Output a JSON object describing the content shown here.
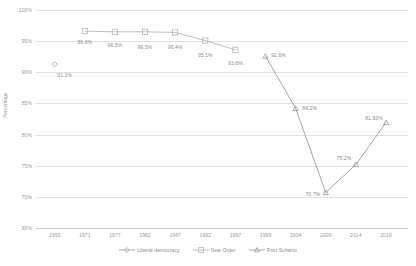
{
  "chart_data": {
    "type": "line",
    "title": "",
    "xlabel": "",
    "ylabel": "Percentage",
    "ylim": [
      65,
      100
    ],
    "ytick_labels": [
      "100%",
      "95%",
      "90%",
      "85%",
      "80%",
      "75%",
      "70%",
      "65%"
    ],
    "ytick_values": [
      100,
      95,
      90,
      85,
      80,
      75,
      70,
      65
    ],
    "grid": true,
    "legend_position": "bottom",
    "categories": [
      "1955",
      "1971",
      "1977",
      "1982",
      "1987",
      "1992",
      "1997",
      "1999",
      "2004",
      "2009",
      "2014",
      "2019"
    ],
    "series": [
      {
        "name": "Liberal democracy",
        "color": "#a6a6a6",
        "marker": "diamond",
        "points": [
          {
            "x": "1955",
            "y": 91.3,
            "label": "91.3%"
          }
        ]
      },
      {
        "name": "New Order",
        "color": "#b7b7b7",
        "marker": "square",
        "points": [
          {
            "x": "1971",
            "y": 96.6,
            "label": "96.6%"
          },
          {
            "x": "1977",
            "y": 96.5,
            "label": "96.5%"
          },
          {
            "x": "1982",
            "y": 96.5,
            "label": "96.5%"
          },
          {
            "x": "1987",
            "y": 96.4,
            "label": "96.4%"
          },
          {
            "x": "1992",
            "y": 95.1,
            "label": "95.1%"
          },
          {
            "x": "1997",
            "y": 93.6,
            "label": "93.6%"
          }
        ]
      },
      {
        "name": "Post Suharto",
        "color": "#9d9d9d",
        "marker": "triangle",
        "points": [
          {
            "x": "1999",
            "y": 92.6,
            "label": "92.6%"
          },
          {
            "x": "2004",
            "y": 84.2,
            "label": "84.2%"
          },
          {
            "x": "2009",
            "y": 70.7,
            "label": "70.7%"
          },
          {
            "x": "2014",
            "y": 75.2,
            "label": "75.2%"
          },
          {
            "x": "2019",
            "y": 81.93,
            "label": "81.93%"
          }
        ]
      }
    ]
  },
  "legend": {
    "items": [
      {
        "label": "Liberal democracy",
        "marker": "diamond",
        "color": "#a6a6a6"
      },
      {
        "label": "New Order",
        "marker": "square",
        "color": "#b7b7b7"
      },
      {
        "label": "Post Suharto",
        "marker": "triangle",
        "color": "#9d9d9d"
      }
    ]
  },
  "axis_title": {
    "y": "Percentage"
  }
}
